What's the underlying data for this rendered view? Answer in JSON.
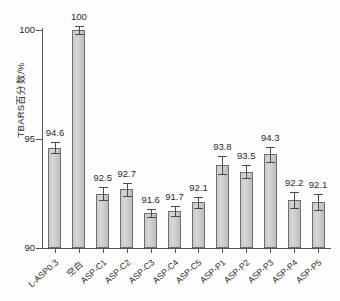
{
  "chart_data": {
    "type": "bar",
    "title": "",
    "xlabel": "",
    "ylabel": "TBARS百分数/%",
    "ylim": [
      90,
      100
    ],
    "yticks": [
      90,
      95,
      100
    ],
    "grid": false,
    "legend": null,
    "categories": [
      "L-ASP0.3",
      "空白",
      "ASP-C1",
      "ASP-C2",
      "ASP-C3",
      "ASP-C4",
      "ASP-C5",
      "ASP-P1",
      "ASP-P2",
      "ASP-P3",
      "ASP-P4",
      "ASP-P5"
    ],
    "values": [
      94.6,
      100,
      92.5,
      92.7,
      91.6,
      91.7,
      92.1,
      93.8,
      93.5,
      94.3,
      92.2,
      92.1
    ],
    "value_labels": [
      "94.6",
      "100",
      "92.5",
      "92.7",
      "91.6",
      "91.7",
      "92.1",
      "93.8",
      "93.5",
      "94.3",
      "92.2",
      "92.1"
    ],
    "errors": [
      0.25,
      0.18,
      0.32,
      0.3,
      0.2,
      0.22,
      0.26,
      0.4,
      0.3,
      0.35,
      0.38,
      0.36
    ],
    "bar_fill_color": "#cccccc",
    "bar_edge_color": "#6e6e6e",
    "axis_color": "#555555",
    "text_color": "#2b2b2b"
  },
  "axis": {
    "y_tick_labels": [
      "90",
      "95",
      "100"
    ]
  }
}
